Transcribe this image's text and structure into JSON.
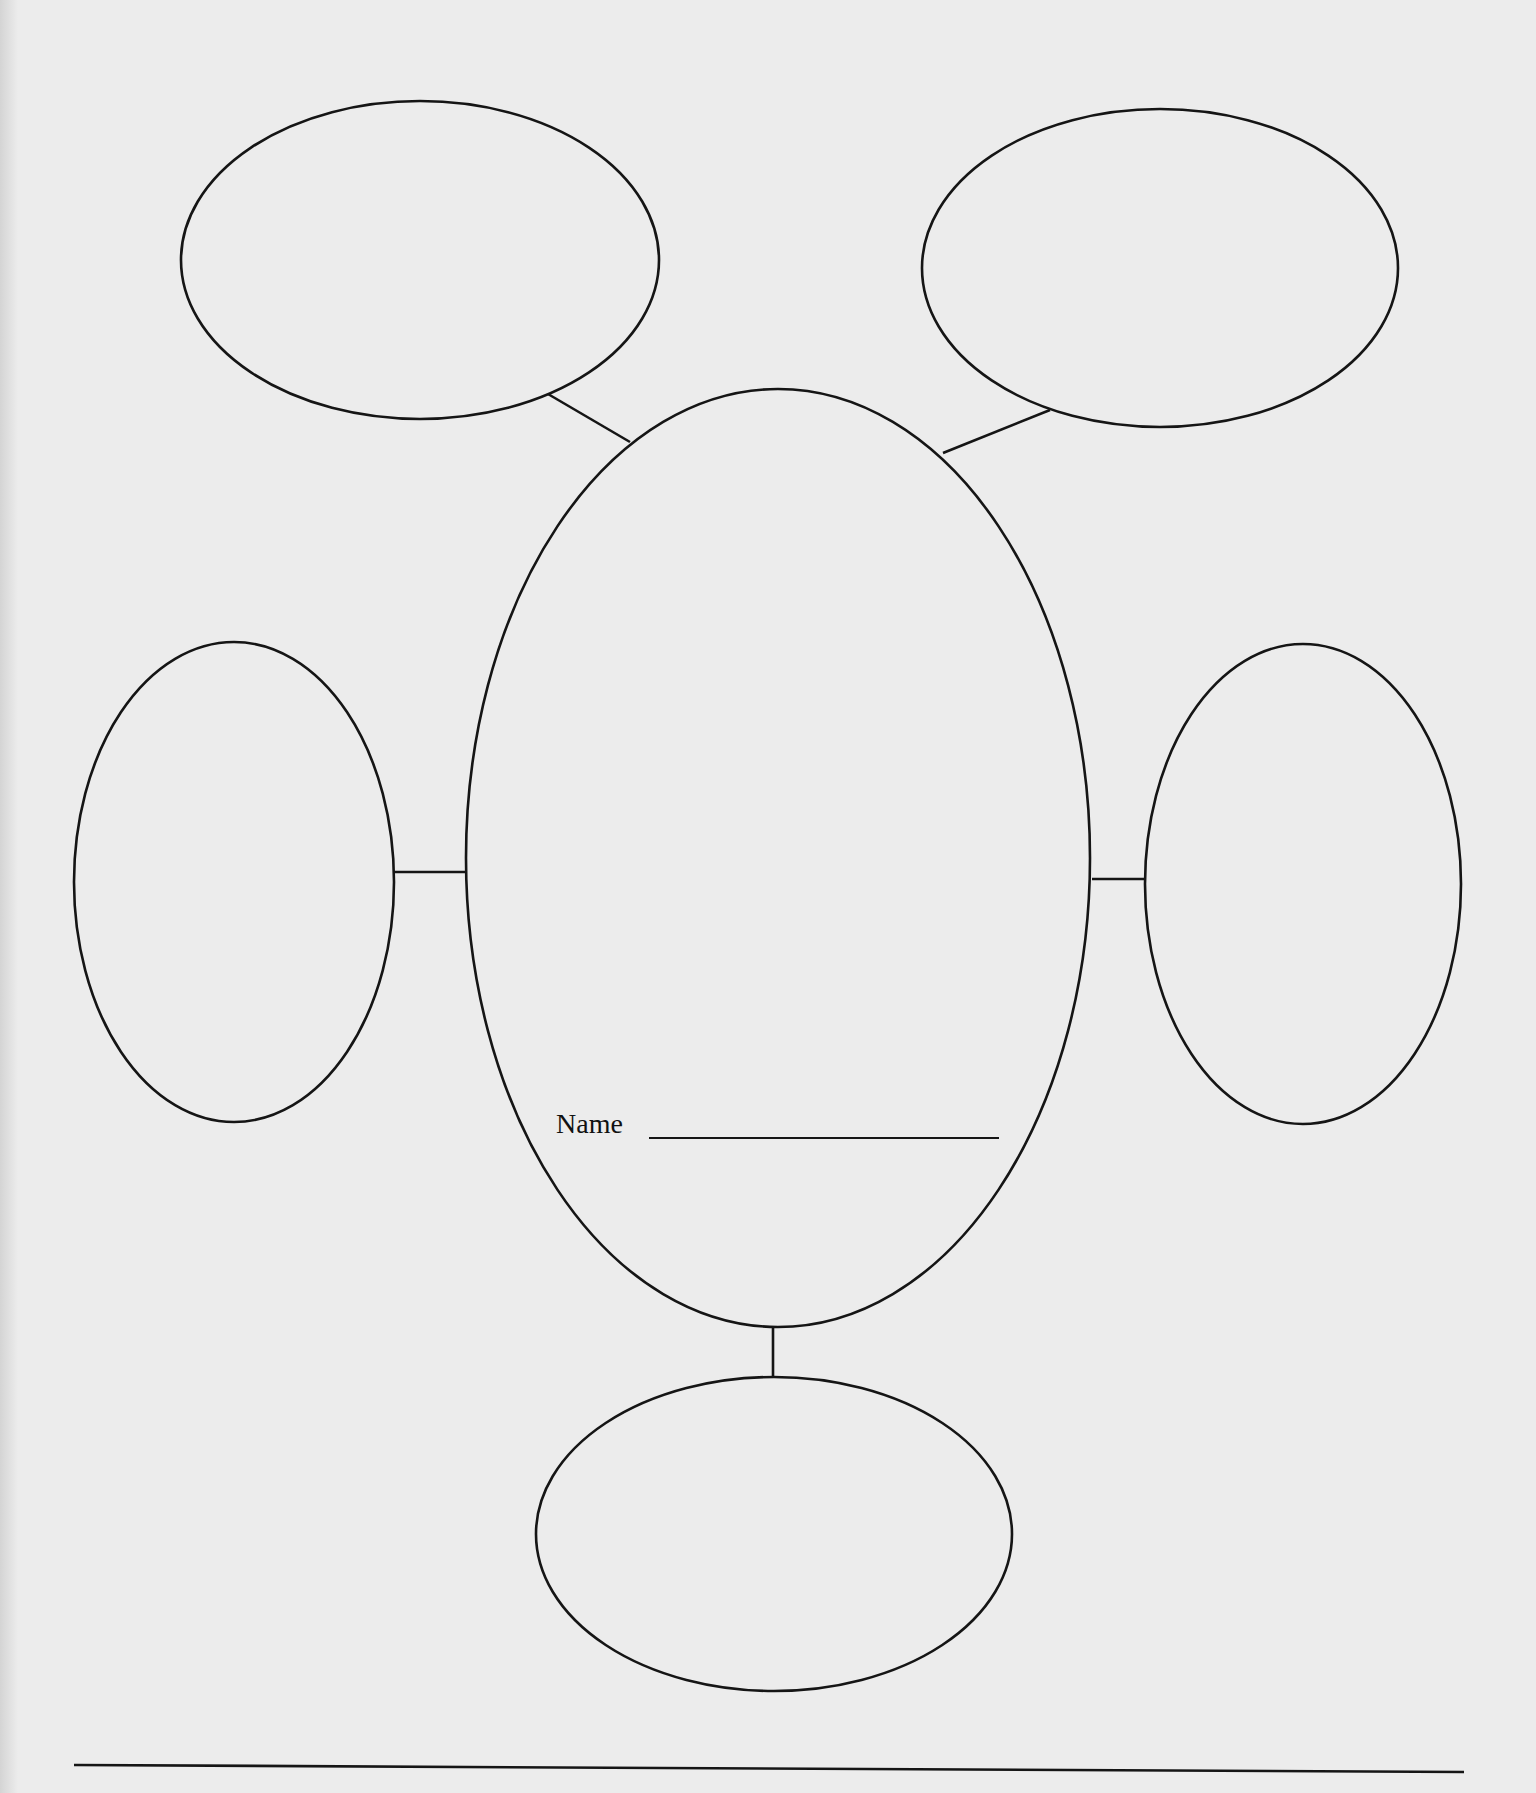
{
  "worksheet": {
    "type": "web / cluster diagram",
    "center_node": {
      "label": "Name",
      "value": ""
    },
    "outer_nodes": [
      {
        "id": "top-left",
        "value": ""
      },
      {
        "id": "top-right",
        "value": ""
      },
      {
        "id": "left",
        "value": ""
      },
      {
        "id": "right",
        "value": ""
      },
      {
        "id": "bottom",
        "value": ""
      }
    ],
    "colors": {
      "paper": "#ececec",
      "ink": "#151515"
    }
  }
}
